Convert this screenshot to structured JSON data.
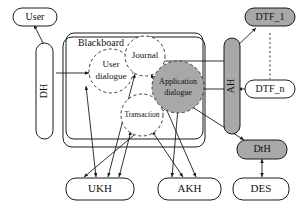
{
  "diagram": {
    "container_label": "Blackboard",
    "colors": {
      "fill_gray": "#a8a8a8",
      "fill_white": "#ffffff",
      "stroke": "#1a1a1a",
      "text": "#111111",
      "dashed_stroke": "#3a3a3a"
    },
    "nodes": {
      "user": {
        "label": "User",
        "shape": "rounded-rect",
        "fill": "#ffffff"
      },
      "dh": {
        "label": "DH",
        "shape": "vertical-bar",
        "fill": "#ffffff",
        "rotated": "true"
      },
      "ah": {
        "label": "AH",
        "shape": "vertical-bar",
        "fill": "#a8a8a8",
        "rotated": "true"
      },
      "user_dialogue": {
        "label_line1": "User",
        "label_line2": "dialogue",
        "shape": "dashed-circle",
        "fill": "#ffffff"
      },
      "journal": {
        "label": "Journal",
        "shape": "dashed-circle",
        "fill": "#ffffff"
      },
      "transaction": {
        "label": "Transaction",
        "shape": "dashed-circle",
        "fill": "#ffffff"
      },
      "application_dialogue": {
        "label_line1": "Application",
        "label_line2": "dialogue",
        "shape": "dashed-circle",
        "fill": "#a8a8a8"
      },
      "dtf_1": {
        "label": "DTF_1",
        "shape": "rounded-rect",
        "fill": "#a8a8a8"
      },
      "dtf_n": {
        "label": "DTF_n",
        "shape": "rounded-rect",
        "fill": "#ffffff"
      },
      "dth": {
        "label": "DtH",
        "shape": "rounded-rect",
        "fill": "#a8a8a8"
      },
      "ukh": {
        "label": "UKH",
        "shape": "rounded-rect",
        "fill": "#ffffff"
      },
      "akh": {
        "label": "AKH",
        "shape": "rounded-rect",
        "fill": "#ffffff"
      },
      "des": {
        "label": "DES",
        "shape": "rounded-rect",
        "fill": "#ffffff"
      }
    },
    "edges": [
      {
        "from": "dh",
        "to": "user",
        "style": "solid"
      },
      {
        "from": "dh",
        "to": "user_dialogue",
        "style": "solid"
      },
      {
        "from": "user_dialogue",
        "to": "ukh",
        "style": "solid"
      },
      {
        "from": "journal",
        "to": "ukh",
        "style": "solid"
      },
      {
        "from": "journal",
        "to": "akh",
        "style": "solid"
      },
      {
        "from": "transaction",
        "to": "ukh",
        "style": "solid"
      },
      {
        "from": "transaction",
        "to": "akh",
        "style": "solid"
      },
      {
        "from": "ah",
        "to": "journal",
        "style": "solid"
      },
      {
        "from": "ah",
        "to": "application_dialogue",
        "style": "solid"
      },
      {
        "from": "ah",
        "to": "dtf_1",
        "style": "solid"
      },
      {
        "from": "ah",
        "to": "dtf_n",
        "style": "solid"
      },
      {
        "from": "dtf_1",
        "to": "dtf_n",
        "style": "dashed"
      },
      {
        "from": "application_dialogue",
        "to": "ukh",
        "style": "solid"
      },
      {
        "from": "application_dialogue",
        "to": "akh",
        "style": "solid"
      },
      {
        "from": "application_dialogue",
        "to": "dth",
        "style": "solid"
      },
      {
        "from": "dth",
        "to": "des",
        "style": "solid"
      }
    ]
  }
}
